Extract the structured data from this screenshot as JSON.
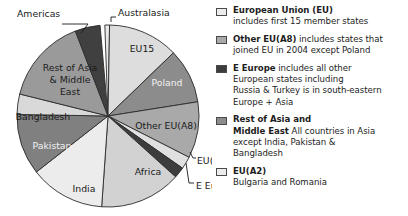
{
  "chart_data": {
    "type": "pie",
    "title": "",
    "unit": "share of total",
    "legend_position": "right",
    "center": {
      "x": 108,
      "y": 116
    },
    "radius": 91,
    "start_angle_deg": -2,
    "categories": [
      "Australasia",
      "EU15",
      "Poland",
      "Other EU(A8)",
      "EU(A2)",
      "E Europe",
      "Africa",
      "India",
      "Pakistan",
      "Bangladesh",
      "Rest of Asia & Middle East",
      "Americas"
    ],
    "values": [
      1.2,
      12.5,
      9.7,
      10.0,
      2.2,
      1.9,
      14.4,
      13.3,
      10.8,
      3.6,
      15.3,
      5.1
    ],
    "slices": [
      {
        "label": "Australasia",
        "start": -2,
        "end": 1,
        "color": "#e8e8e8",
        "label_mode": "callout",
        "label_x": 118,
        "label_y": 13,
        "anchor": "start",
        "leader": "M 111 22 L 111 17 L 116 17"
      },
      {
        "label": "EU15",
        "start": 1,
        "end": 46,
        "color": "#dddddd",
        "label_mode": "inside",
        "label_x": 142,
        "label_y": 49
      },
      {
        "label": "Poland",
        "start": 46,
        "end": 81,
        "color": "#8c8c8c",
        "label_mode": "inside",
        "label_x": 167,
        "label_y": 83
      },
      {
        "label": "Other EU(A8)",
        "start": 81,
        "end": 117,
        "color": "#a9a9a9",
        "label_mode": "inside",
        "label_x": 166,
        "label_y": 126
      },
      {
        "label": "EU(A2)",
        "start": 117,
        "end": 125,
        "color": "#e0e0e0",
        "label_mode": "callout",
        "label_x": 197,
        "label_y": 161,
        "anchor": "start",
        "leader": "M 190 152 L 193 158 L 196 158"
      },
      {
        "label": "E Europe",
        "start": 125,
        "end": 132,
        "color": "#3d3d3d",
        "label_mode": "callout",
        "label_x": 196,
        "label_y": 186,
        "anchor": "start",
        "leader": "M 186 163 L 189 183 L 194 183"
      },
      {
        "label": "Africa",
        "start": 132,
        "end": 184,
        "color": "#d2d2d2",
        "label_mode": "inside",
        "label_x": 148,
        "label_y": 172
      },
      {
        "label": "India",
        "start": 184,
        "end": 232,
        "color": "#ececec",
        "label_mode": "inside",
        "label_x": 84,
        "label_y": 189
      },
      {
        "label": "Pakistan",
        "start": 232,
        "end": 271,
        "color": "#808080",
        "label_mode": "inside",
        "label_x": 52,
        "label_y": 146
      },
      {
        "label": "Bangladesh",
        "start": 271,
        "end": 284,
        "color": "#d9d9d9",
        "label_mode": "inside",
        "label_x": 43,
        "label_y": 117
      },
      {
        "label": "Rest of Asia & Middle East",
        "start": 284,
        "end": 339,
        "color": "#9a9a9a",
        "label_mode": "inside-multiline",
        "label_x": 70,
        "label_y": 68,
        "lines": [
          "Rest of Asia",
          "& Middle",
          "East"
        ]
      },
      {
        "label": "Americas",
        "start": 339,
        "end": 355,
        "color": "#404040",
        "label_mode": "callout",
        "label_x": 17,
        "label_y": 14,
        "anchor": "start",
        "leader": "M 81 33 L 88 24 L 62 24"
      }
    ]
  },
  "legend": {
    "entries": [
      {
        "swatch": "#ececec",
        "title": "European Union (EU)",
        "body": "",
        "extra_lines": [
          "includes first 15 member states"
        ]
      },
      {
        "swatch": "#a9a9a9",
        "title": "Other EU(A8)",
        "body": " includes states that",
        "extra_lines": [
          "joined EU in 2004 except Poland"
        ]
      },
      {
        "swatch": "#3d3d3d",
        "title": "E Europe",
        "body": " includes all other",
        "extra_lines": [
          "European states including",
          "Russia & Turkey is in south-eastern",
          "Europe + Asia"
        ]
      },
      {
        "swatch": "#8c8c8c",
        "title": "Rest of Asia and",
        "body": "",
        "title2": "Middle East",
        "body2": " All countries in Asia",
        "extra_lines": [
          "except India, Pakistan &",
          "Bangladesh"
        ]
      },
      {
        "swatch": "#ececec",
        "title": "EU(A2)",
        "body": "",
        "extra_lines": [
          "Bulgaria and Romania"
        ]
      }
    ]
  }
}
